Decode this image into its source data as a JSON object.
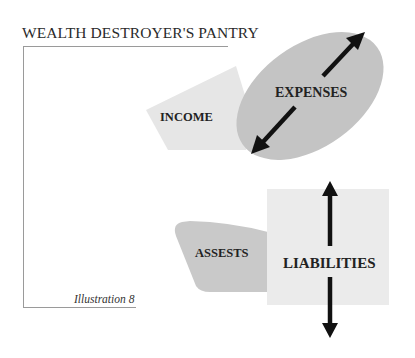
{
  "title": "WEALTH DESTROYER'S PANTRY",
  "caption": "Illustration 8",
  "colors": {
    "income_fill": "#e6e6e6",
    "expenses_fill": "#c4c4c4",
    "assets_fill": "#c9c9c9",
    "liabilities_fill": "#ebebeb",
    "arrow": "#111111",
    "frame_line": "#9a9a9a",
    "text": "#222222"
  },
  "shapes": {
    "income": {
      "label": "INCOME",
      "icon": "polygon-shape"
    },
    "expenses": {
      "label": "EXPENSES",
      "icon": "ellipse-shape",
      "arrows": "diagonal-double-arrow-icon"
    },
    "assets": {
      "label": "ASSESTS",
      "icon": "rounded-trapezoid-shape"
    },
    "liabilities": {
      "label": "LIABILITIES",
      "icon": "square-shape",
      "arrows": "vertical-double-arrow-icon"
    }
  }
}
